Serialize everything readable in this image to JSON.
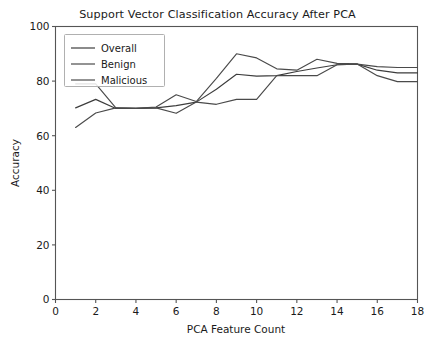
{
  "chart_data": {
    "type": "line",
    "title": "Support Vector Classification Accuracy After PCA",
    "xlabel": "PCA Feature Count",
    "ylabel": "Accuracy",
    "xlim": [
      0,
      18
    ],
    "ylim": [
      0,
      100
    ],
    "xticks": [
      0,
      2,
      4,
      6,
      8,
      10,
      12,
      14,
      16,
      18
    ],
    "yticks": [
      0,
      20,
      40,
      60,
      80,
      100
    ],
    "grid": false,
    "legend_position": "upper left",
    "x": [
      1,
      2,
      3,
      4,
      5,
      6,
      7,
      8,
      9,
      10,
      11,
      12,
      13,
      14,
      15,
      16,
      17,
      18
    ],
    "series": [
      {
        "name": "Overall",
        "color": "#3d3d3d",
        "values": [
          70.2,
          73.3,
          70.0,
          70.0,
          70.2,
          71.0,
          72.3,
          77.0,
          82.5,
          81.8,
          82.0,
          83.5,
          84.8,
          86.0,
          86.2,
          84.0,
          83.0,
          83.0
        ]
      },
      {
        "name": "Benign",
        "color": "#4a4a4a",
        "values": [
          79.0,
          79.0,
          70.2,
          70.0,
          70.5,
          75.0,
          72.5,
          81.0,
          90.0,
          88.5,
          84.5,
          84.0,
          88.0,
          86.5,
          86.3,
          82.0,
          79.8,
          79.8
        ]
      },
      {
        "name": "Malicious",
        "color": "#4a4a4a",
        "values": [
          63.0,
          68.3,
          70.2,
          70.0,
          70.2,
          68.2,
          72.3,
          71.5,
          73.3,
          73.3,
          82.0,
          82.0,
          82.0,
          86.0,
          86.2,
          85.3,
          85.0,
          85.0
        ]
      }
    ],
    "legend": [
      "Overall",
      "Benign",
      "Malicious"
    ]
  }
}
